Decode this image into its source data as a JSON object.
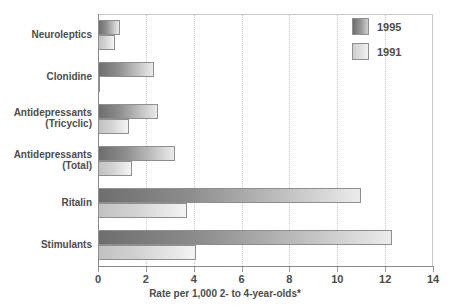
{
  "chart_data": {
    "type": "bar",
    "orientation": "horizontal",
    "title": "",
    "xlabel": "Rate per 1,000 2- to 4-year-olds*",
    "ylabel": "",
    "xlim": [
      0,
      14
    ],
    "xticks": [
      0,
      2,
      4,
      6,
      8,
      10,
      12,
      14
    ],
    "xtick_labels": [
      "0",
      "2",
      "4",
      "6",
      "8",
      "10",
      "12",
      "14"
    ],
    "grid": true,
    "grid_axis": "x",
    "legend_position": "top-right",
    "categories": [
      "Neuroleptics",
      "Clonidine",
      "Antidepressants (Tricyclic)",
      "Antidepressants (Total)",
      "Ritalin",
      "Stimulants"
    ],
    "category_lines": [
      [
        "Neuroleptics"
      ],
      [
        "Clonidine"
      ],
      [
        "Antidepressants",
        "(Tricyclic)"
      ],
      [
        "Antidepressants",
        "(Total)"
      ],
      [
        "Ritalin"
      ],
      [
        "Stimulants"
      ]
    ],
    "series": [
      {
        "name": "1995",
        "color": "#6e6e6e",
        "values": [
          0.9,
          2.35,
          2.5,
          3.2,
          11.0,
          12.3
        ]
      },
      {
        "name": "1991",
        "color": "#cecece",
        "values": [
          0.7,
          0.1,
          1.3,
          1.4,
          3.7,
          4.1
        ]
      }
    ]
  },
  "legend": {
    "items": [
      {
        "label": "1995"
      },
      {
        "label": "1991"
      }
    ]
  },
  "axis": {
    "caption": "Rate per 1,000 2- to 4-year-olds*"
  }
}
